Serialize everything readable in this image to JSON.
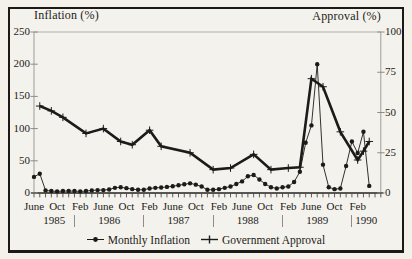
{
  "figure": {
    "left_axis_title": "Inflation (%)",
    "right_axis_title": "Approval (%)",
    "left_ticks": [
      0,
      50,
      100,
      150,
      200,
      250
    ],
    "right_ticks": [
      0,
      25,
      50,
      75,
      100
    ],
    "x_month_labels": [
      {
        "m": 0,
        "label": "June"
      },
      {
        "m": 4,
        "label": "Oct"
      },
      {
        "m": 8,
        "label": "Feb"
      },
      {
        "m": 12,
        "label": "June"
      },
      {
        "m": 16,
        "label": "Oct"
      },
      {
        "m": 20,
        "label": "Feb"
      },
      {
        "m": 24,
        "label": "June"
      },
      {
        "m": 28,
        "label": "Oct"
      },
      {
        "m": 32,
        "label": "Feb"
      },
      {
        "m": 36,
        "label": "June"
      },
      {
        "m": 40,
        "label": "Oct"
      },
      {
        "m": 44,
        "label": "Feb"
      },
      {
        "m": 48,
        "label": "June"
      },
      {
        "m": 52,
        "label": "Oct"
      },
      {
        "m": 56,
        "label": "Feb"
      }
    ],
    "years": [
      {
        "label": "1985",
        "m_center": 3.5
      },
      {
        "label": "1986",
        "m_center": 13
      },
      {
        "label": "1987",
        "m_center": 25
      },
      {
        "label": "1988",
        "m_center": 37
      },
      {
        "label": "1989",
        "m_center": 49
      },
      {
        "label": "1990",
        "m_center": 57.5
      }
    ],
    "year_separators_m": [
      7,
      19,
      31,
      43,
      55
    ],
    "legend": [
      {
        "label": "Monthly Inflation",
        "marker": "dot"
      },
      {
        "label": "Government Approval",
        "marker": "plus"
      }
    ],
    "colors": {
      "ink": "#1c1b19",
      "axis_gray": "#8e8b85",
      "grid_light": "#b3b0a9",
      "background": "#f4f2ec"
    }
  },
  "chart_data": {
    "type": "line",
    "title": "",
    "x_start": "June 1985",
    "x_end": "April 1990",
    "x_unit": "month",
    "left_axis": {
      "label": "Inflation (%)",
      "range": [
        0,
        250
      ]
    },
    "right_axis": {
      "label": "Approval (%)",
      "range": [
        0,
        100
      ]
    },
    "legend_position": "bottom",
    "grid": false,
    "series": [
      {
        "name": "Monthly Inflation",
        "axis": "left",
        "marker": "dot",
        "line_weight": "thin",
        "start_month": "1985-06",
        "values": [
          25,
          30,
          4,
          3,
          2.5,
          3,
          3,
          3,
          2.5,
          3,
          4,
          4.5,
          4.5,
          5.5,
          8,
          9,
          7.5,
          6,
          5,
          5,
          7,
          8,
          8.5,
          9.5,
          10.5,
          12,
          13.5,
          15,
          13,
          10,
          5,
          5,
          6,
          8,
          10,
          14,
          18,
          26,
          28,
          21,
          14,
          9,
          7,
          9,
          10,
          17,
          33,
          78,
          105,
          200,
          44,
          9,
          6,
          7,
          42,
          80,
          62,
          95,
          11
        ]
      },
      {
        "name": "Government Approval",
        "axis": "right",
        "marker": "plus",
        "line_weight": "thick",
        "points_month_value": [
          [
            1,
            54
          ],
          [
            3,
            51
          ],
          [
            5,
            47
          ],
          [
            9,
            37
          ],
          [
            12,
            40
          ],
          [
            15,
            32
          ],
          [
            17,
            30
          ],
          [
            20,
            39
          ],
          [
            22,
            29
          ],
          [
            27,
            25
          ],
          [
            31,
            14.5
          ],
          [
            34,
            15.5
          ],
          [
            38,
            24
          ],
          [
            41,
            14.5
          ],
          [
            44,
            15.5
          ],
          [
            46,
            16
          ],
          [
            48,
            71
          ],
          [
            50,
            66
          ],
          [
            53,
            38
          ],
          [
            56,
            20.5
          ],
          [
            57,
            26
          ],
          [
            58,
            32
          ]
        ]
      }
    ]
  }
}
